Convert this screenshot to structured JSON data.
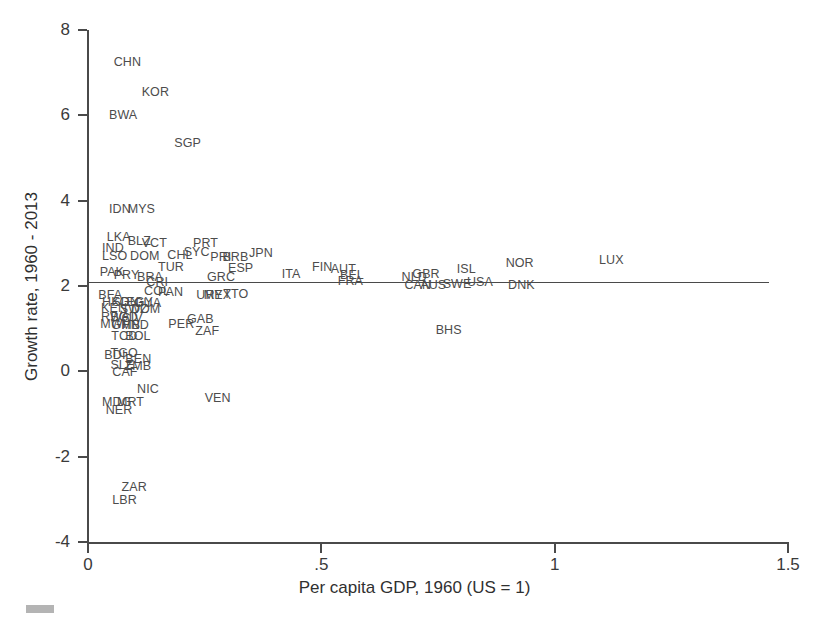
{
  "chart_data": {
    "type": "scatter",
    "title": "",
    "xlabel": "Per capita GDP, 1960 (US = 1)",
    "ylabel": "Growth rate, 1960 - 2013",
    "xlim": [
      0,
      1.5
    ],
    "ylim": [
      -4,
      8
    ],
    "xticks": [
      0,
      0.5,
      1,
      1.5
    ],
    "xticklabels": [
      "0",
      ".5",
      "1",
      "1.5"
    ],
    "yticks": [
      -4,
      -2,
      0,
      2,
      4,
      6,
      8
    ],
    "yticklabels": [
      "-4",
      "-2",
      "0",
      "2",
      "4",
      "6",
      "8"
    ],
    "grid": false,
    "legend": null,
    "marker_style": "text-labels-only",
    "annotations": [
      {
        "type": "hline",
        "y": 2.1,
        "x_start": 0.0,
        "x_end": 1.46,
        "label": "world average growth reference line"
      }
    ],
    "points": [
      {
        "label": "CHN",
        "x": 0.055,
        "y": 7.25
      },
      {
        "label": "KOR",
        "x": 0.115,
        "y": 6.55
      },
      {
        "label": "BWA",
        "x": 0.045,
        "y": 6.0
      },
      {
        "label": "SGP",
        "x": 0.185,
        "y": 5.35
      },
      {
        "label": "IDN",
        "x": 0.045,
        "y": 3.8
      },
      {
        "label": "MYS",
        "x": 0.085,
        "y": 3.8
      },
      {
        "label": "LKA",
        "x": 0.04,
        "y": 3.15
      },
      {
        "label": "BLZ",
        "x": 0.085,
        "y": 3.05
      },
      {
        "label": "VCT",
        "x": 0.115,
        "y": 3.0
      },
      {
        "label": "IND",
        "x": 0.03,
        "y": 2.9
      },
      {
        "label": "PRT",
        "x": 0.225,
        "y": 3.0
      },
      {
        "label": "LSO",
        "x": 0.03,
        "y": 2.7
      },
      {
        "label": "DOM",
        "x": 0.09,
        "y": 2.7
      },
      {
        "label": "CHL",
        "x": 0.17,
        "y": 2.72
      },
      {
        "label": "SYC",
        "x": 0.205,
        "y": 2.8
      },
      {
        "label": "PRI",
        "x": 0.262,
        "y": 2.68
      },
      {
        "label": "BRB",
        "x": 0.288,
        "y": 2.68
      },
      {
        "label": "JPN",
        "x": 0.345,
        "y": 2.78
      },
      {
        "label": "ESP",
        "x": 0.3,
        "y": 2.42
      },
      {
        "label": "PAK",
        "x": 0.025,
        "y": 2.32
      },
      {
        "label": "PRY",
        "x": 0.055,
        "y": 2.25
      },
      {
        "label": "TUR",
        "x": 0.15,
        "y": 2.45
      },
      {
        "label": "BRA",
        "x": 0.105,
        "y": 2.22
      },
      {
        "label": "GRC",
        "x": 0.255,
        "y": 2.22
      },
      {
        "label": "ITA",
        "x": 0.415,
        "y": 2.28
      },
      {
        "label": "FIN",
        "x": 0.48,
        "y": 2.45
      },
      {
        "label": "AUT",
        "x": 0.52,
        "y": 2.4
      },
      {
        "label": "BEL",
        "x": 0.54,
        "y": 2.26
      },
      {
        "label": "FRA",
        "x": 0.535,
        "y": 2.12
      },
      {
        "label": "GBR",
        "x": 0.695,
        "y": 2.28
      },
      {
        "label": "NLD",
        "x": 0.672,
        "y": 2.2
      },
      {
        "label": "ISL",
        "x": 0.79,
        "y": 2.4
      },
      {
        "label": "NOR",
        "x": 0.895,
        "y": 2.55
      },
      {
        "label": "LUX",
        "x": 1.095,
        "y": 2.62
      },
      {
        "label": "CAN",
        "x": 0.678,
        "y": 2.02
      },
      {
        "label": "AUS",
        "x": 0.712,
        "y": 2.02
      },
      {
        "label": "SWE",
        "x": 0.76,
        "y": 2.05
      },
      {
        "label": "USA",
        "x": 0.812,
        "y": 2.1
      },
      {
        "label": "DNK",
        "x": 0.9,
        "y": 2.02
      },
      {
        "label": "CRI",
        "x": 0.125,
        "y": 2.1
      },
      {
        "label": "COL",
        "x": 0.12,
        "y": 1.88
      },
      {
        "label": "PAN",
        "x": 0.15,
        "y": 1.85
      },
      {
        "label": "BFA",
        "x": 0.022,
        "y": 1.78
      },
      {
        "label": "URY",
        "x": 0.232,
        "y": 1.8
      },
      {
        "label": "MEX",
        "x": 0.248,
        "y": 1.8
      },
      {
        "label": "TTO",
        "x": 0.29,
        "y": 1.82
      },
      {
        "label": "HKG",
        "x": 0.03,
        "y": 1.62
      },
      {
        "label": "SDN",
        "x": 0.052,
        "y": 1.62
      },
      {
        "label": "EGY",
        "x": 0.082,
        "y": 1.62
      },
      {
        "label": "GUA",
        "x": 0.098,
        "y": 1.6
      },
      {
        "label": "KEN",
        "x": 0.028,
        "y": 1.48
      },
      {
        "label": "SWZ",
        "x": 0.068,
        "y": 1.45
      },
      {
        "label": "DOM",
        "x": 0.092,
        "y": 1.45
      },
      {
        "label": "RWA",
        "x": 0.028,
        "y": 1.28
      },
      {
        "label": "BGD",
        "x": 0.048,
        "y": 1.28
      },
      {
        "label": "CIV",
        "x": 0.072,
        "y": 1.25
      },
      {
        "label": "PER",
        "x": 0.172,
        "y": 1.12
      },
      {
        "label": "GAB",
        "x": 0.212,
        "y": 1.22
      },
      {
        "label": "MWI",
        "x": 0.026,
        "y": 1.1
      },
      {
        "label": "GMB",
        "x": 0.05,
        "y": 1.08
      },
      {
        "label": "HND",
        "x": 0.072,
        "y": 1.08
      },
      {
        "label": "ZAF",
        "x": 0.23,
        "y": 0.95
      },
      {
        "label": "TCD",
        "x": 0.05,
        "y": 0.82
      },
      {
        "label": "BOL",
        "x": 0.08,
        "y": 0.82
      },
      {
        "label": "BDI",
        "x": 0.035,
        "y": 0.38
      },
      {
        "label": "TGO",
        "x": 0.048,
        "y": 0.42
      },
      {
        "label": "BEN",
        "x": 0.08,
        "y": 0.3
      },
      {
        "label": "SLE",
        "x": 0.048,
        "y": 0.15
      },
      {
        "label": "ZMB",
        "x": 0.078,
        "y": 0.12
      },
      {
        "label": "CAF",
        "x": 0.052,
        "y": -0.02
      },
      {
        "label": "NIC",
        "x": 0.105,
        "y": -0.42
      },
      {
        "label": "MDG",
        "x": 0.03,
        "y": -0.72
      },
      {
        "label": "MRT",
        "x": 0.062,
        "y": -0.72
      },
      {
        "label": "NER",
        "x": 0.038,
        "y": -0.9
      },
      {
        "label": "VEN",
        "x": 0.25,
        "y": -0.62
      },
      {
        "label": "BHS",
        "x": 0.745,
        "y": 0.98
      },
      {
        "label": "ZAR",
        "x": 0.072,
        "y": -2.7
      },
      {
        "label": "LBR",
        "x": 0.052,
        "y": -3.02
      }
    ]
  },
  "decor": {
    "scan_artifact": "gray-smudge"
  }
}
